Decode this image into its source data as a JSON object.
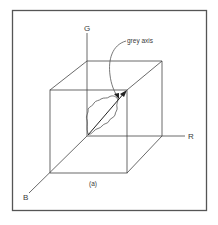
{
  "figure": {
    "caption": "(a)",
    "frame_color": "#555555",
    "line_color": "#444444",
    "background": "#ffffff"
  },
  "axes": {
    "g_label": "G",
    "r_label": "R",
    "b_label": "B"
  },
  "annotation": {
    "label": "grey axis"
  }
}
